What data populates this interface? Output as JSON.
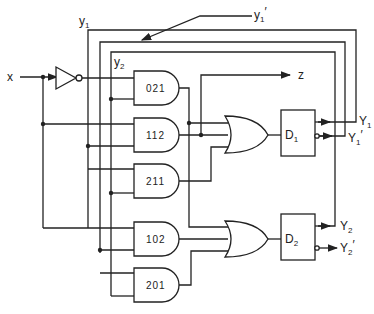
{
  "diagram": {
    "type": "sequential-logic-circuit",
    "input": {
      "label": "x"
    },
    "output": {
      "label": "z"
    },
    "feedback_labels": {
      "y1": "y",
      "y1_sub": "1",
      "y1_prime": "y",
      "y1_prime_sub": "1",
      "y1_prime_mark": "′",
      "y2": "y",
      "y2_sub": "2"
    },
    "inverter": {
      "name": "inverter"
    },
    "and_gates": [
      {
        "id": "021",
        "label": "021"
      },
      {
        "id": "112",
        "label": "112"
      },
      {
        "id": "211",
        "label": "211"
      },
      {
        "id": "102",
        "label": "102"
      },
      {
        "id": "201",
        "label": "201"
      }
    ],
    "or_gates": [
      {
        "id": "or1",
        "inputs": [
          "021",
          "112",
          "211"
        ],
        "drives": "D1"
      },
      {
        "id": "or2",
        "inputs": [
          "021",
          "102",
          "201"
        ],
        "drives": "D2"
      }
    ],
    "flip_flops": [
      {
        "id": "D1",
        "label": "D",
        "sub": "1",
        "q": "Y",
        "q_sub": "1",
        "qn": "Y",
        "qn_sub": "1",
        "qn_mark": "′"
      },
      {
        "id": "D2",
        "label": "D",
        "sub": "2",
        "q": "Y",
        "q_sub": "2",
        "qn": "Y",
        "qn_sub": "2",
        "qn_mark": "′"
      }
    ]
  }
}
